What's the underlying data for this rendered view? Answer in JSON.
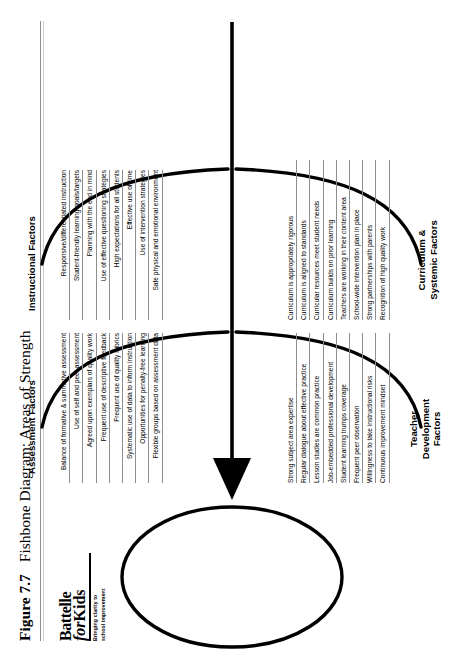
{
  "figure": {
    "number": "Figure 7.7",
    "caption": "Fishbone Diagram: Areas of Strength"
  },
  "logo": {
    "line1": "Battelle",
    "line2_italic": "for",
    "line2_bold": "Kids",
    "tagline_line1": "Bringing clarity to",
    "tagline_line2": "school improvement"
  },
  "diagram": {
    "type": "fishbone",
    "head_label": "",
    "branches": [
      {
        "id": "assessment-factors",
        "label": "Assessment Factors",
        "position": "upper-left",
        "items": [
          "Balance of formative & summative assessment",
          "Use of self and peer assessment",
          "Agreed upon exemplars of quality work",
          "Frequent use of descriptive feedback",
          "Frequent use of quality rubrics",
          "Systematic use of data to inform instruction",
          "Opportunities for penalty-free learning",
          "Flexible groups based on assessment data"
        ]
      },
      {
        "id": "instructional-factors",
        "label": "Instructional Factors",
        "position": "upper-right",
        "items": [
          "Responsive/differentiated instruction",
          "Student-friendly learning goals/targets",
          "Planning with the end in mind",
          "Use of effective questioning strategies",
          "High expectations for all students",
          "Effective use of time",
          "Use of intervention strategies",
          "Safe physical and emotional environment"
        ]
      },
      {
        "id": "teacher-development-factors",
        "label_line1": "Teacher",
        "label_line2": "Development",
        "label_line3": "Factors",
        "label": "Teacher Development Factors",
        "position": "lower-left",
        "items": [
          "Strong subject area expertise",
          "Regular dialogue about effective practice",
          "Lesson studies are common practice",
          "Job-embedded professional development",
          "Student learning trumps coverage",
          "Frequent peer observation",
          "Willingness to take instructional risks",
          "Continuous improvement mindset"
        ]
      },
      {
        "id": "curriculum-systemic-factors",
        "label_line1": "Curriculum &",
        "label_line2": "Systemic Factors",
        "label": "Curriculum & Systemic Factors",
        "position": "lower-right",
        "items": [
          "Curriculum is appropriately rigorous",
          "Curriculum is aligned to standards",
          "Curricular resources meet student needs",
          "Curriculum builds on prior learning",
          "Teachers are working in their content area",
          "School-wide intervention plan in place",
          "Strong partnerships with parents",
          "Recognition of high quality work"
        ]
      }
    ]
  },
  "colors": {
    "ink": "#000000",
    "rule": "#8e8e8e",
    "header_rule": "#8d8d8d"
  }
}
